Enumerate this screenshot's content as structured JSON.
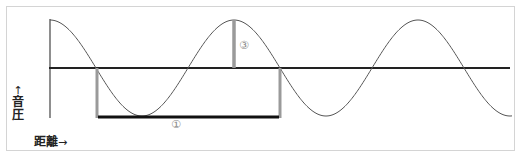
{
  "labels": {
    "y_axis": "音圧",
    "y_arrow": "↑",
    "x_axis": "距離",
    "x_arrow": "→",
    "marker_wavelength": "①",
    "marker_amplitude": "③"
  },
  "colors": {
    "wave": "#555555",
    "axis": "#222222",
    "baseline": "#222222",
    "marker_bar": "#999999",
    "wavelength_bar": "#111111",
    "frame": "#d4d4d4"
  },
  "diagram": {
    "type": "sound wave (sine) with wavelength and amplitude markers",
    "wave": {
      "x_start": 50,
      "baseline_y": 68,
      "amplitude_px": 48,
      "half_period_px": 92
    },
    "wavelength_marker": {
      "label": "①",
      "x_from": 97,
      "x_to": 280,
      "y": 117
    },
    "amplitude_marker": {
      "label": "③",
      "x": 234,
      "y_from": 20,
      "y_to": 68
    }
  }
}
